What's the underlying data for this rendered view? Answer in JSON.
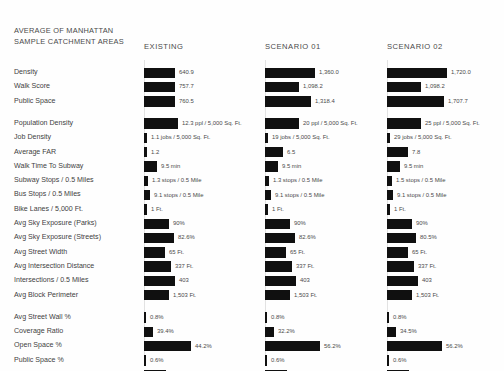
{
  "header": {
    "title_line1": "AVERAGE OF MANHATTAN",
    "title_line2": "SAMPLE CATCHMENT AREAS",
    "columns": [
      "EXISTING",
      "SCENARIO 01",
      "SCENARIO 02"
    ]
  },
  "chart_data": {
    "type": "bar",
    "title": "AVERAGE OF MANHATTAN SAMPLE CATCHMENT AREAS",
    "xlabel": "",
    "ylabel": "",
    "grid": true,
    "legend_position": "top",
    "categories": [
      "Density",
      "Walk Score",
      "Public Space",
      "Population Density",
      "Job Density",
      "Average FAR",
      "Walk Time To Subway",
      "Subway Stops / 0.5 Miles",
      "Bus Stops / 0.5 Miles",
      "Bike Lanes / 5,000 Ft.",
      "Avg Sky Exposure (Parks)",
      "Avg Sky Exposure (Streets)",
      "Avg Street Width",
      "Avg Intersection Distance",
      "Intersections / 0.5 Miles",
      "Avg Block Perimeter",
      "Avg Street Wall %",
      "Coverage Ratio",
      "Open Space %",
      "Public Space %",
      "Retail %"
    ],
    "series": [
      {
        "name": "EXISTING",
        "labels": [
          "640.9",
          "757.7",
          "760.5",
          "12.3 ppl / 5,000 Sq. Ft.",
          "1.1 jobs / 5,000 Sq. Ft.",
          "1.2",
          "9.5 min",
          "1.3 stops / 0.5 Mile",
          "9.1 stops / 0.5 Mile",
          "1 Ft.",
          "90%",
          "82.6%",
          "65 Ft.",
          "337 Ft.",
          "403",
          "1,503 Ft.",
          "0.8%",
          "39.4%",
          "44.2%",
          "0.6%",
          "8%"
        ],
        "values": [
          640.9,
          757.7,
          760.5,
          12.3,
          1.1,
          1.2,
          9.5,
          1.3,
          9.1,
          1,
          90,
          82.6,
          65,
          337,
          403,
          1503,
          0.8,
          39.4,
          44.2,
          0.6,
          8
        ]
      },
      {
        "name": "SCENARIO 01",
        "labels": [
          "1,360.0",
          "1,098.2",
          "1,318.4",
          "20 ppl / 5,000 Sq. Ft.",
          "19 jobs / 5,000 Sq. Ft.",
          "6.5",
          "9.5 min",
          "1.3 stops / 0.5 Mile",
          "9.1 stops / 0.5 Mile",
          "1 Ft.",
          "90%",
          "82.6%",
          "65 Ft.",
          "337 Ft.",
          "403",
          "1,503 Ft.",
          "0.8%",
          "32.2%",
          "56.2%",
          "0.6%",
          "8%"
        ],
        "values": [
          1360.0,
          1098.2,
          1318.4,
          20,
          19,
          6.5,
          9.5,
          1.3,
          9.1,
          1,
          90,
          82.6,
          65,
          337,
          403,
          1503,
          0.8,
          32.2,
          56.2,
          0.6,
          8
        ]
      },
      {
        "name": "SCENARIO 02",
        "labels": [
          "1,720.0",
          "1,098.2",
          "1,707.7",
          "25 ppl / 5,000 Sq. Ft.",
          "29 jobs / 5,000 Sq. Ft.",
          "7.8",
          "9.5 min",
          "1.5 stops / 0.5 Mile",
          "9.1 stops / 0.5 Mile",
          "1 Ft.",
          "90%",
          "80.5%",
          "65 Ft.",
          "337 Ft.",
          "403",
          "1,503 Ft.",
          "0.8%",
          "34.5%",
          "56.2%",
          "0.6%",
          "6%"
        ],
        "values": [
          1720.0,
          1098.2,
          1707.7,
          25,
          29,
          7.8,
          9.5,
          1.5,
          9.1,
          1,
          90,
          80.5,
          65,
          337,
          403,
          1503,
          0.8,
          34.5,
          56.2,
          0.6,
          6
        ]
      }
    ]
  },
  "layout": {
    "bar_pixel_widths": [
      [
        31,
        31,
        31,
        34,
        3,
        3,
        13,
        4,
        6,
        3,
        25,
        30,
        21,
        27,
        31,
        25,
        2,
        9,
        47,
        2,
        22
      ],
      [
        50,
        34,
        46,
        34,
        3,
        18,
        13,
        4,
        6,
        3,
        25,
        30,
        21,
        27,
        31,
        25,
        2,
        9,
        55,
        2,
        22
      ],
      [
        60,
        34,
        57,
        34,
        3,
        21,
        13,
        5,
        6,
        3,
        25,
        29,
        21,
        27,
        31,
        25,
        2,
        9,
        55,
        2,
        22
      ]
    ],
    "value_inside_bar": [
      [
        false,
        false,
        false,
        false,
        false,
        false,
        false,
        false,
        false,
        false,
        false,
        false,
        false,
        false,
        false,
        false,
        false,
        false,
        false,
        false,
        false
      ],
      [
        false,
        false,
        false,
        false,
        false,
        false,
        false,
        false,
        false,
        false,
        false,
        false,
        false,
        false,
        false,
        false,
        false,
        false,
        false,
        false,
        false
      ],
      [
        false,
        false,
        false,
        false,
        false,
        false,
        false,
        false,
        false,
        false,
        false,
        false,
        false,
        false,
        false,
        false,
        false,
        false,
        false,
        false,
        false
      ]
    ],
    "column_x": [
      144,
      265,
      387
    ],
    "gridline_x": [
      144,
      265,
      387
    ],
    "row_top_start": 66,
    "row_height": 14.3,
    "group_gap_after": [
      2,
      15
    ]
  },
  "colors": {
    "bar": "#101010",
    "text": "#3f3f3f",
    "value_text": "#4a4a4a",
    "gridline": "#e2e2e2",
    "background": "#ffffff"
  }
}
